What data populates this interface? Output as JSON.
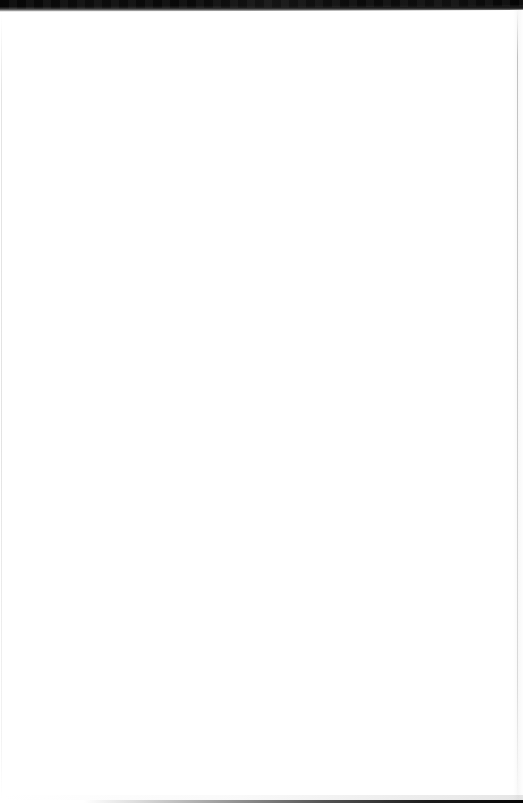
{
  "document": {
    "page_type": "scanned-blank-page",
    "content_text": "",
    "visible_text_count": 0,
    "page_number_label": "",
    "header_text": "",
    "footer_text": ""
  },
  "canvas": {
    "width_px": 523,
    "height_px": 806,
    "background_color": "#ffffff",
    "paper_color": "#ffffff"
  },
  "scan_artifacts": {
    "top_band": {
      "name": "top-edge-shadow",
      "color": "#0b0b0b",
      "height_left_px": 11,
      "height_right_px": 7,
      "description": "dark scanner bed / book gutter shadow across the top"
    },
    "bottom_line": {
      "name": "bottom-edge-line",
      "color": "#050505",
      "thickness_px": 3,
      "fade_start_x_px": 100,
      "description": "thin dark page edge line, fades in from left, darkest at right"
    },
    "left_hairline": {
      "name": "left-edge-line",
      "color": "#cecece",
      "x_px": 1,
      "thickness_px": 1
    },
    "right_hairline": {
      "name": "right-edge-line",
      "color": "#a8a8a8",
      "x_px": 517,
      "thickness_px": 1
    }
  }
}
